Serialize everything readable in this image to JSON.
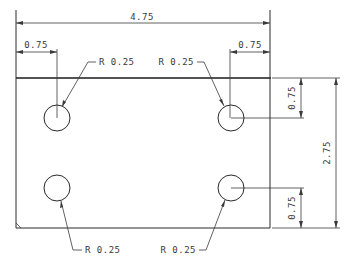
{
  "drawing": {
    "type": "technical-drawing",
    "part": "rectangular plate with four holes",
    "units": "in",
    "dimensions": {
      "overall_width": "4.75",
      "overall_height": "2.75",
      "hole_offset_left": "0.75",
      "hole_offset_right": "0.75",
      "hole_offset_top": "0.75",
      "hole_offset_bottom": "0.75"
    },
    "holes": [
      {
        "position": "top-left",
        "label": "R 0.25"
      },
      {
        "position": "top-right",
        "label": "R 0.25"
      },
      {
        "position": "bottom-left",
        "label": "R 0.25"
      },
      {
        "position": "bottom-right",
        "label": "R 0.25"
      }
    ]
  }
}
